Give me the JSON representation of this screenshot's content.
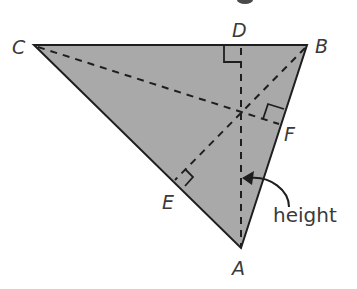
{
  "figure": {
    "colors": {
      "fill": "#a9a9a9",
      "stroke": "#1e1e1e",
      "label": "#3a3a3a",
      "background": "#ffffff"
    },
    "vertices": {
      "A": {
        "label": "A",
        "x": 241,
        "y": 248
      },
      "B": {
        "label": "B",
        "x": 307,
        "y": 45
      },
      "C": {
        "label": "C",
        "x": 34,
        "y": 45
      }
    },
    "feet": {
      "D": {
        "label": "D",
        "x": 241,
        "y": 45
      },
      "E": {
        "label": "E",
        "x": 173,
        "y": 181
      },
      "F": {
        "label": "F",
        "x": 281,
        "y": 125
      }
    },
    "altitudes": [
      "AD",
      "BE",
      "CF"
    ],
    "annotation": {
      "text": "height",
      "points_to": "AD"
    }
  }
}
